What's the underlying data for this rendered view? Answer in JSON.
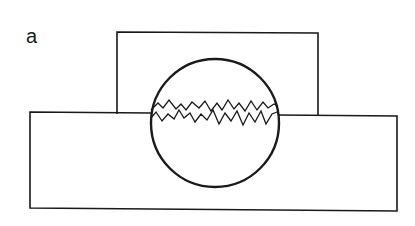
{
  "figure": {
    "panel_label": "a",
    "stroke_color": "#1a1a1a",
    "background": "#ffffff"
  },
  "shapes": {
    "upper_block": {
      "x": 117,
      "y": 32,
      "w": 201,
      "h": 83
    },
    "lower_block": {
      "x": 30,
      "y": 112,
      "w": 368,
      "h": 99
    },
    "sphere": {
      "cx": 215,
      "cy": 123,
      "r": 65
    },
    "fracture_lines": [
      "M151,110 L158,103 L163,108 L169,100 L176,109 L181,104 L186,110 L192,102 L199,108 L205,101 L211,111 L217,103 L222,110 L228,100 L234,109 L239,103 L245,111 L251,101 L257,110 L263,102 L268,108 L274,104 L278,106",
      "M151,118 L156,112 L162,121 L168,114 L174,119 L179,110 L184,118 L190,113 L195,122 L201,114 L207,120 L213,110 L219,124 L225,113 L231,121 L237,111 L243,125 L249,113 L255,122 L261,111 L266,124 L272,114 L277,112"
    ]
  }
}
